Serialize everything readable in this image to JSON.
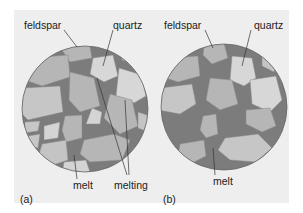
{
  "figure": {
    "colors": {
      "background": "#eeeeee",
      "melt": "#7c7c7c",
      "feldspar": "#b6b6b6",
      "quartz": "#d7d7d7",
      "outline": "#666666"
    },
    "panel_a": {
      "tag": "(a)",
      "labels": {
        "feldspar": "feldspar",
        "quartz": "quartz",
        "melt": "melt",
        "melting": "melting"
      }
    },
    "panel_b": {
      "tag": "(b)",
      "labels": {
        "feldspar": "feldspar",
        "quartz": "quartz",
        "melt": "melt"
      }
    }
  }
}
